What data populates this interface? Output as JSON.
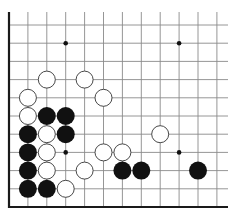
{
  "board": {
    "title": "Go board diagram (lower-left corner)",
    "colors": {
      "background": "#ffffff",
      "grid_line": "#8a8a8a",
      "edge_line": "#1a1a1a",
      "black_stone": "#111111",
      "white_stone_fill": "#ffffff",
      "white_stone_border": "#333333",
      "star_point": "#111111"
    },
    "geometry": {
      "origin_x": 9,
      "origin_y": 25,
      "col_spacing": 18.9,
      "row_spacing": 18.2,
      "columns": 12,
      "rows": 10,
      "bottom_edge_y": 207,
      "top_open_y": 12,
      "right_open_x": 228,
      "stone_radius": 9
    },
    "edges": [
      "left",
      "bottom"
    ],
    "star_points": [
      {
        "col": 3,
        "row": 1
      },
      {
        "col": 9,
        "row": 1
      },
      {
        "col": 3,
        "row": 7
      },
      {
        "col": 9,
        "row": 7
      }
    ],
    "stones": [
      {
        "color": "white",
        "col": 2,
        "row": 3
      },
      {
        "color": "white",
        "col": 4,
        "row": 3
      },
      {
        "color": "white",
        "col": 1,
        "row": 4
      },
      {
        "color": "white",
        "col": 5,
        "row": 4
      },
      {
        "color": "white",
        "col": 1,
        "row": 5
      },
      {
        "color": "black",
        "col": 2,
        "row": 5
      },
      {
        "color": "black",
        "col": 3,
        "row": 5
      },
      {
        "color": "black",
        "col": 1,
        "row": 6
      },
      {
        "color": "white",
        "col": 2,
        "row": 6
      },
      {
        "color": "black",
        "col": 3,
        "row": 6
      },
      {
        "color": "white",
        "col": 8,
        "row": 6
      },
      {
        "color": "black",
        "col": 1,
        "row": 7
      },
      {
        "color": "white",
        "col": 2,
        "row": 7
      },
      {
        "color": "white",
        "col": 5,
        "row": 7
      },
      {
        "color": "white",
        "col": 6,
        "row": 7
      },
      {
        "color": "black",
        "col": 1,
        "row": 8
      },
      {
        "color": "white",
        "col": 2,
        "row": 8
      },
      {
        "color": "white",
        "col": 4,
        "row": 8
      },
      {
        "color": "black",
        "col": 6,
        "row": 8
      },
      {
        "color": "black",
        "col": 7,
        "row": 8
      },
      {
        "color": "black",
        "col": 10,
        "row": 8
      },
      {
        "color": "black",
        "col": 1,
        "row": 9
      },
      {
        "color": "black",
        "col": 2,
        "row": 9
      },
      {
        "color": "white",
        "col": 3,
        "row": 9
      }
    ],
    "stone_counts": {
      "black": 11,
      "white": 13
    }
  }
}
